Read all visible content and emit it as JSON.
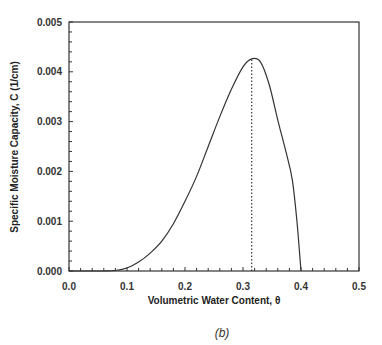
{
  "figure": {
    "caption": "(b)"
  },
  "chart_data": {
    "type": "line",
    "title": "",
    "xlabel": "Volumetric Water Content, θ",
    "ylabel": "Specific Moisture Capacity, C (1/cm)",
    "xlim": [
      0.0,
      0.5
    ],
    "ylim": [
      0.0,
      0.005
    ],
    "x_ticks": [
      "0.0",
      "0.1",
      "0.2",
      "0.3",
      "0.4",
      "0.5"
    ],
    "y_ticks": [
      "0.000",
      "0.001",
      "0.002",
      "0.003",
      "0.004",
      "0.005"
    ],
    "grid": false,
    "legend": null,
    "series": [
      {
        "name": "C(θ)",
        "style": "solid",
        "x": [
          0.0,
          0.06,
          0.08,
          0.1,
          0.12,
          0.14,
          0.16,
          0.18,
          0.2,
          0.22,
          0.24,
          0.26,
          0.28,
          0.3,
          0.315,
          0.33,
          0.345,
          0.36,
          0.375,
          0.385,
          0.393,
          0.4
        ],
        "values": [
          0.0,
          0.0,
          1e-05,
          6e-05,
          0.00018,
          0.00036,
          0.0006,
          0.00095,
          0.0014,
          0.0019,
          0.0025,
          0.0031,
          0.00365,
          0.0041,
          0.00426,
          0.0042,
          0.00375,
          0.00303,
          0.00235,
          0.00183,
          0.001,
          0.0
        ]
      }
    ],
    "annotations": [
      {
        "type": "vertical-dotted-line",
        "x": 0.315,
        "y_from": 0.0,
        "y_to": 0.00426,
        "label": "peak"
      }
    ]
  }
}
